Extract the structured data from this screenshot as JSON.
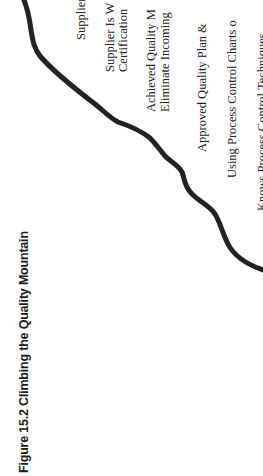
{
  "figure": {
    "title": "Figure 15.2 Climbing the Quality Mountain",
    "curve_color": "#222222",
    "text_color": "#222222",
    "orientation": "rotated 90 degrees counter-clockwise"
  },
  "labels": [
    {
      "text": "Supplier",
      "x": 75,
      "y": 40
    },
    {
      "text": "Supplier Is W",
      "x": 104,
      "y": 72
    },
    {
      "text": "Certification",
      "x": 117,
      "y": 72
    },
    {
      "text": "Achieved Quality M",
      "x": 145,
      "y": 112
    },
    {
      "text": "Eliminate Incoming",
      "x": 159,
      "y": 112
    },
    {
      "text": "Approved Quality Plan &",
      "x": 196,
      "y": 152
    },
    {
      "text": "Using Process Control Charts o",
      "x": 226,
      "y": 178
    },
    {
      "text": "Knows Process Control Techniques",
      "x": 256,
      "y": 211
    }
  ]
}
